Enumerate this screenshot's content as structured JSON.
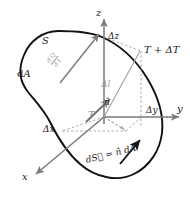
{
  "figure": {
    "background_color": "#ffffff",
    "outline_color": "#111111",
    "axis_color": "#7a7a7a",
    "dashed_color": "#9a9a9a",
    "gray_arrow_color": "#7d7d7d"
  },
  "labels": {
    "surface": "S",
    "area_element": "dA",
    "heat_rate_numerator": "d Q",
    "heat_rate_denominator": "d t",
    "axis_z": "z",
    "axis_y": "y",
    "axis_x": "x",
    "delta_z": "Δz",
    "delta_y": "Δy",
    "delta_x": "Δx",
    "delta_l": "Δl",
    "normal": "n̂",
    "temperature": "T",
    "temperature_plus": "T + ΔT",
    "surface_vector": "dS⃗ = n̂ dA"
  },
  "chart_data": {
    "type": "diagram",
    "elements": [
      {
        "name": "closed-surface-blob",
        "label": "S",
        "style": "solid-black-curve"
      },
      {
        "name": "z-axis",
        "label": "z",
        "direction": "up",
        "style": "gray-arrow"
      },
      {
        "name": "y-axis",
        "label": "y",
        "direction": "right",
        "style": "gray-arrow"
      },
      {
        "name": "x-axis",
        "label": "x",
        "direction": "down-left",
        "style": "gray-arrow"
      },
      {
        "name": "origin-point",
        "label": "T"
      },
      {
        "name": "corner-point",
        "label": "T + ΔT"
      },
      {
        "name": "normal-vector",
        "label": "n̂",
        "style": "gray-arrow"
      },
      {
        "name": "delta-l-segment",
        "label": "Δl",
        "style": "gray-line"
      },
      {
        "name": "heat-flux-arrow",
        "label": "dQ/dt",
        "style": "gray-arrow-through-surface"
      },
      {
        "name": "surface-vector-arrow",
        "label": "dS⃗ = n̂ dA",
        "style": "black-arrow"
      },
      {
        "name": "projection-box",
        "style": "dashed"
      }
    ]
  }
}
